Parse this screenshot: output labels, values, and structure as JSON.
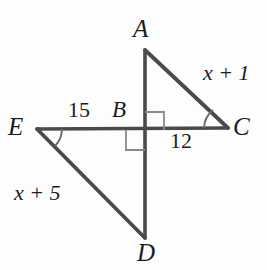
{
  "figure": {
    "kind": "geometry-diagram",
    "background_color": "#fdfdfd",
    "stroke_color": "#4a4a4a",
    "text_color": "#1c1c1c"
  },
  "points": [
    {
      "id": "A",
      "label": "A",
      "x": 145,
      "y": 50
    },
    {
      "id": "B",
      "label": "B",
      "x": 145,
      "y": 130
    },
    {
      "id": "C",
      "label": "C",
      "x": 228,
      "y": 128
    },
    {
      "id": "D",
      "label": "D",
      "x": 145,
      "y": 238
    },
    {
      "id": "E",
      "label": "E",
      "x": 37,
      "y": 129
    }
  ],
  "segments": [
    {
      "id": "AD",
      "from": "A",
      "to": "D"
    },
    {
      "id": "EC",
      "from": "E",
      "to": "C"
    },
    {
      "id": "AC",
      "from": "A",
      "to": "C"
    },
    {
      "id": "ED",
      "from": "E",
      "to": "D"
    }
  ],
  "right_angle_marks": [
    {
      "id": "angle-ABC",
      "at": "B",
      "quadrant": "upper-right"
    },
    {
      "id": "angle-EBD",
      "at": "B",
      "quadrant": "lower-left"
    }
  ],
  "angle_arcs": [
    {
      "id": "angle-at-C",
      "at": "C"
    },
    {
      "id": "angle-at-E",
      "at": "E"
    }
  ],
  "measures": [
    {
      "id": "x-plus-1",
      "text": "x + 1",
      "segment": "AC",
      "style": "italic"
    },
    {
      "id": "x-plus-5",
      "text": "x + 5",
      "segment": "ED",
      "style": "italic"
    },
    {
      "id": "fifteen",
      "text": "15",
      "segment": "EB",
      "style": "numeric"
    },
    {
      "id": "twelve",
      "text": "12",
      "segment": "BC",
      "style": "numeric"
    }
  ]
}
